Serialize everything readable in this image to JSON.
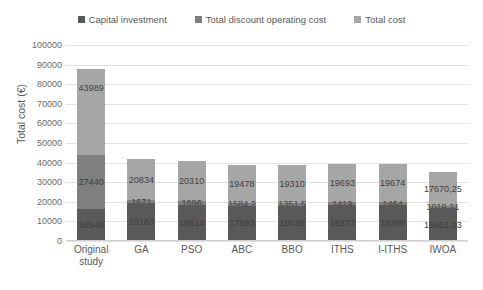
{
  "chart_data": {
    "type": "bar",
    "subtype": "stacked-bar",
    "title": "",
    "xlabel": "",
    "ylabel": "Total cost (€)",
    "ylim": [
      0,
      100000
    ],
    "ytick_step": 10000,
    "yticks": [
      "100000",
      "90000",
      "80000",
      "70000",
      "60000",
      "50000",
      "40000",
      "30000",
      "20000",
      "10000",
      "0"
    ],
    "grid": true,
    "legend_position": "top-center",
    "categories": [
      "Original study",
      "GA",
      "PSO",
      "ABC",
      "BBO",
      "ITHS",
      "I-ITHS",
      "IWOA"
    ],
    "series": [
      {
        "name": "Capital investment",
        "color": "#595959",
        "values": [
          16549,
          19163,
          18614,
          17893,
          18039,
          18273,
          18209,
          16651.03
        ],
        "labels": [
          "16549",
          "19163",
          "18614",
          "17893",
          "18039",
          "18273",
          "18209",
          "16651,03"
        ]
      },
      {
        "name": "Total discount operating cost",
        "color": "#7f7f7f",
        "values": [
          27440,
          1671,
          1696,
          1584.2,
          1351.5,
          1419,
          1464,
          1019.21
        ],
        "labels": [
          "27440",
          "1671",
          "1696",
          "1584,2",
          "1351,5",
          "1419",
          "1464",
          "1019,21"
        ]
      },
      {
        "name": "Total cost",
        "color": "#a6a6a6",
        "values": [
          43989,
          20834,
          20310,
          19478,
          19310,
          19693,
          19674,
          17670.25
        ],
        "labels": [
          "43989",
          "20834",
          "20310",
          "19478",
          "19310",
          "19693",
          "19674",
          "17670,25"
        ]
      }
    ]
  },
  "legend": {
    "items": [
      {
        "label": "Capital investment",
        "color": "#595959"
      },
      {
        "label": "Total discount operating cost",
        "color": "#7f7f7f"
      },
      {
        "label": "Total cost",
        "color": "#a6a6a6"
      }
    ]
  },
  "axis": {
    "y_title": "Total cost (€)"
  },
  "colors": {
    "gridline": "#e3e3e3",
    "text": "#595959",
    "label_text": "#3f3f3f",
    "background": "#ffffff"
  }
}
